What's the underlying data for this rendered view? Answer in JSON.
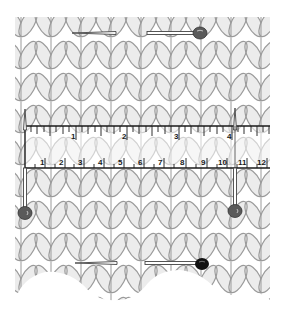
{
  "colors": {
    "fabric_fill": "#ececec",
    "fabric_stroke": "#9a9a9a",
    "gap_fill": "#ffffff",
    "ruler_line": "#1a1a1a",
    "pin_shaft": "#ffffff",
    "pin_shaft_outline": "#444444",
    "pin_head_gray": "#5a5a5a",
    "pin_head_black": "#111111",
    "background": "#ffffff"
  },
  "ruler": {
    "inch_labels": [
      "1",
      "2",
      "3",
      "4"
    ],
    "cm_labels": [
      "1",
      "2",
      "3",
      "4",
      "5",
      "6",
      "7",
      "8",
      "9",
      "10",
      "11",
      "12"
    ]
  },
  "pins": [
    {
      "name": "top-pin",
      "orientation": "horizontal",
      "head_color": "gray"
    },
    {
      "name": "bottom-pin",
      "orientation": "horizontal",
      "head_color": "black"
    },
    {
      "name": "left-pin",
      "orientation": "vertical",
      "head_color": "gray"
    },
    {
      "name": "right-pin",
      "orientation": "vertical",
      "head_color": "gray"
    }
  ]
}
